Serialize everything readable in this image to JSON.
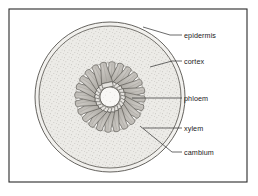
{
  "figure": {
    "type": "botanical-cross-section-diagram",
    "frame": {
      "visible": true,
      "color": "#2b2b2b",
      "x": 9,
      "y": 9,
      "width": 238,
      "height": 173
    },
    "background_color": "#ffffff",
    "line_color": "#3a3a3a"
  },
  "structure": {
    "center": {
      "x": 110,
      "y": 97
    },
    "outer_radius": 75,
    "epidermis_gap": 4,
    "cortex_fill": "#eceae6",
    "pith_fill": "#f7f6f4",
    "bundle_ring_radius": 43,
    "bundle_count": 24,
    "bundle_xylem_fill": "#b9b6b1",
    "bundle_phloem_fill": "#e4e2de",
    "stipple_color": "#9a968f"
  },
  "labels": [
    {
      "id": "epidermis",
      "text": "epidermis",
      "text_x": 184,
      "text_y": 38,
      "leader": [
        [
          182,
          35
        ],
        [
          170,
          35
        ],
        [
          143,
          27
        ]
      ]
    },
    {
      "id": "cortex",
      "text": "cortex",
      "text_x": 184,
      "text_y": 64,
      "leader": [
        [
          182,
          61
        ],
        [
          172,
          61
        ],
        [
          150,
          67
        ]
      ]
    },
    {
      "id": "phloem",
      "text": "phloem",
      "text_x": 184,
      "text_y": 101,
      "leader": [
        [
          182,
          98
        ],
        [
          132,
          98
        ]
      ]
    },
    {
      "id": "xylem",
      "text": "xylem",
      "text_x": 184,
      "text_y": 131,
      "leader": [
        [
          182,
          128
        ],
        [
          143,
          128
        ]
      ]
    },
    {
      "id": "cambium",
      "text": "cambium",
      "text_x": 184,
      "text_y": 155,
      "leader": [
        [
          182,
          152
        ],
        [
          172,
          152
        ],
        [
          140,
          126
        ]
      ]
    }
  ]
}
